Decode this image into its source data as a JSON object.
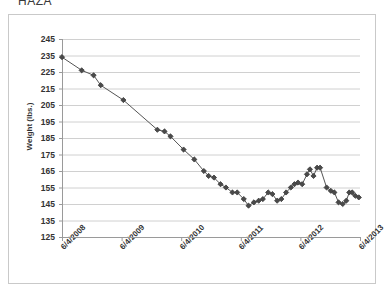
{
  "window": {
    "clipped_top_text": "HAZA"
  },
  "chart_data": {
    "type": "line",
    "title": "",
    "xlabel": "",
    "ylabel": "Weight (lbs.)",
    "ylim": [
      125,
      245
    ],
    "ytick_step": 10,
    "yticks": [
      245,
      235,
      225,
      215,
      205,
      195,
      185,
      175,
      165,
      155,
      145,
      135,
      125
    ],
    "xticks": [
      "6/4/2008",
      "6/4/2009",
      "6/4/2010",
      "6/4/2011",
      "6/4/2012",
      "6/4/2013"
    ],
    "xlim_years": [
      2008.42,
      2013.42
    ],
    "grid": "horizontal",
    "legend": "none",
    "marker": "diamond",
    "series": [
      {
        "name": "Weight",
        "color": "#555555",
        "points": [
          {
            "x": 2008.42,
            "y": 234
          },
          {
            "x": 2008.75,
            "y": 226
          },
          {
            "x": 2008.95,
            "y": 223
          },
          {
            "x": 2009.07,
            "y": 217
          },
          {
            "x": 2009.45,
            "y": 208
          },
          {
            "x": 2010.02,
            "y": 190
          },
          {
            "x": 2010.14,
            "y": 189
          },
          {
            "x": 2010.24,
            "y": 186
          },
          {
            "x": 2010.46,
            "y": 178
          },
          {
            "x": 2010.64,
            "y": 172
          },
          {
            "x": 2010.8,
            "y": 165
          },
          {
            "x": 2010.88,
            "y": 162
          },
          {
            "x": 2010.97,
            "y": 161
          },
          {
            "x": 2011.08,
            "y": 157
          },
          {
            "x": 2011.17,
            "y": 155
          },
          {
            "x": 2011.28,
            "y": 152
          },
          {
            "x": 2011.36,
            "y": 152
          },
          {
            "x": 2011.47,
            "y": 148
          },
          {
            "x": 2011.55,
            "y": 144
          },
          {
            "x": 2011.64,
            "y": 146
          },
          {
            "x": 2011.72,
            "y": 147
          },
          {
            "x": 2011.79,
            "y": 148
          },
          {
            "x": 2011.88,
            "y": 152
          },
          {
            "x": 2011.95,
            "y": 151
          },
          {
            "x": 2012.03,
            "y": 147
          },
          {
            "x": 2012.1,
            "y": 148
          },
          {
            "x": 2012.18,
            "y": 152
          },
          {
            "x": 2012.26,
            "y": 155
          },
          {
            "x": 2012.32,
            "y": 157
          },
          {
            "x": 2012.38,
            "y": 158
          },
          {
            "x": 2012.45,
            "y": 157
          },
          {
            "x": 2012.53,
            "y": 163
          },
          {
            "x": 2012.58,
            "y": 166
          },
          {
            "x": 2012.64,
            "y": 162
          },
          {
            "x": 2012.7,
            "y": 167
          },
          {
            "x": 2012.75,
            "y": 167
          },
          {
            "x": 2012.86,
            "y": 155
          },
          {
            "x": 2012.93,
            "y": 153
          },
          {
            "x": 2012.99,
            "y": 152
          },
          {
            "x": 2013.06,
            "y": 146
          },
          {
            "x": 2013.13,
            "y": 145
          },
          {
            "x": 2013.19,
            "y": 147
          },
          {
            "x": 2013.24,
            "y": 152
          },
          {
            "x": 2013.29,
            "y": 152
          },
          {
            "x": 2013.34,
            "y": 150
          },
          {
            "x": 2013.4,
            "y": 149
          }
        ]
      }
    ]
  }
}
